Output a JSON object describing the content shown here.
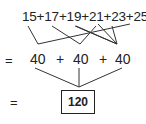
{
  "expression": "15+17+19+21+23+25",
  "terms": [
    "15",
    "17",
    "19",
    "21",
    "23",
    "25"
  ],
  "pair_sums": [
    "40",
    "40",
    "40"
  ],
  "operators": [
    "+",
    "+"
  ],
  "equals": "=",
  "result": "120",
  "pairings": [
    [
      "15",
      "25"
    ],
    [
      "17",
      "23"
    ],
    [
      "19",
      "21"
    ]
  ]
}
